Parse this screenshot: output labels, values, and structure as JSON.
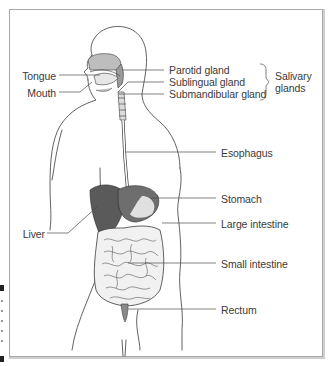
{
  "figure": {
    "colors": {
      "line": "#3a3a3a",
      "frame": "#a9a9a9",
      "organ_dark": "#5a5a5a",
      "organ_mid": "#9a9a9a",
      "organ_light": "#dcdcdc"
    }
  },
  "labels": {
    "left": [
      {
        "id": "tongue",
        "text": "Tongue"
      },
      {
        "id": "mouth",
        "text": "Mouth"
      },
      {
        "id": "liver",
        "text": "Liver"
      }
    ],
    "right": [
      {
        "id": "parotid",
        "text": "Parotid gland"
      },
      {
        "id": "sublingual",
        "text": "Sublingual gland"
      },
      {
        "id": "submandibular",
        "text": "Submandibular gland"
      },
      {
        "id": "esophagus",
        "text": "Esophagus"
      },
      {
        "id": "stomach",
        "text": "Stomach"
      },
      {
        "id": "large_intestine",
        "text": "Large intestine"
      },
      {
        "id": "small_intestine",
        "text": "Small intestine"
      },
      {
        "id": "rectum",
        "text": "Rectum"
      }
    ],
    "group": {
      "id": "salivary_glands",
      "line1": "Salivary",
      "line2": "glands"
    }
  }
}
